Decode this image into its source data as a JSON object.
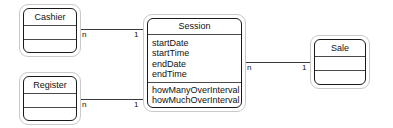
{
  "diagram": {
    "type": "uml-class-diagram",
    "canvas": {
      "width": 393,
      "height": 128,
      "background": "#ffffff"
    },
    "stroke_color": "#1a1a1a",
    "halo_color": "#c9c9c9"
  },
  "classes": {
    "cashier": {
      "name": "Cashier",
      "compartments": [
        "Cashier",
        "",
        ""
      ],
      "attributes": [],
      "operations": []
    },
    "register": {
      "name": "Register",
      "compartments": [
        "Register",
        "",
        ""
      ],
      "attributes": [],
      "operations": []
    },
    "session": {
      "name": "Session",
      "attributes": [
        "startDate",
        "startTime",
        "endDate",
        "endTime"
      ],
      "operations": [
        "howManyOverInterval",
        "howMuchOverInterval"
      ]
    },
    "sale": {
      "name": "Sale",
      "compartments": [
        "Sale",
        "",
        ""
      ],
      "attributes": [],
      "operations": []
    }
  },
  "associations": [
    {
      "id": "cashier-session",
      "from": "Cashier",
      "to": "Session",
      "from_multiplicity": "n",
      "to_multiplicity": "1"
    },
    {
      "id": "register-session",
      "from": "Register",
      "to": "Session",
      "from_multiplicity": "n",
      "to_multiplicity": "1"
    },
    {
      "id": "session-sale",
      "from": "Session",
      "to": "Sale",
      "from_multiplicity": "n",
      "to_multiplicity": "1"
    }
  ]
}
